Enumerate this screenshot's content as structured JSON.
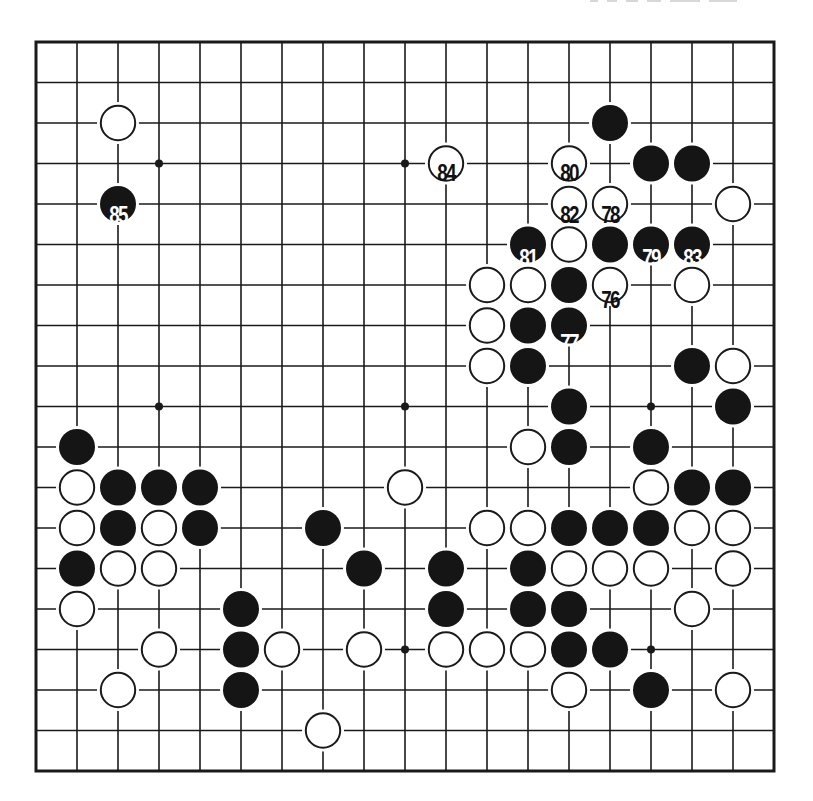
{
  "diagram": {
    "type": "go-board",
    "size": 19,
    "colors": {
      "line": "#1a1a1a",
      "black_stone": "#151515",
      "white_stone": "#ffffff",
      "paper": "#ffffff"
    },
    "geometry": {
      "origin_x": 36,
      "origin_y": 42,
      "step_x": 41,
      "step_y": 40.5,
      "stone_radius": 18
    },
    "star_points": [
      [
        3,
        3
      ],
      [
        9,
        3
      ],
      [
        15,
        3
      ],
      [
        3,
        9
      ],
      [
        9,
        9
      ],
      [
        15,
        9
      ],
      [
        3,
        15
      ],
      [
        9,
        15
      ],
      [
        15,
        15
      ]
    ],
    "move_range": "76-85",
    "stones": [
      {
        "c": 14,
        "r": 2,
        "color": "black",
        "label": ""
      },
      {
        "c": 15,
        "r": 3,
        "color": "black",
        "label": ""
      },
      {
        "c": 16,
        "r": 3,
        "color": "black",
        "label": ""
      },
      {
        "c": 2,
        "r": 4,
        "color": "black",
        "label": "85"
      },
      {
        "c": 12,
        "r": 5,
        "color": "black",
        "label": "81"
      },
      {
        "c": 14,
        "r": 5,
        "color": "black",
        "label": ""
      },
      {
        "c": 15,
        "r": 5,
        "color": "black",
        "label": "79"
      },
      {
        "c": 16,
        "r": 5,
        "color": "black",
        "label": "83"
      },
      {
        "c": 13,
        "r": 6,
        "color": "black",
        "label": ""
      },
      {
        "c": 12,
        "r": 7,
        "color": "black",
        "label": ""
      },
      {
        "c": 13,
        "r": 7,
        "color": "black",
        "label": "77"
      },
      {
        "c": 12,
        "r": 8,
        "color": "black",
        "label": ""
      },
      {
        "c": 16,
        "r": 8,
        "color": "black",
        "label": ""
      },
      {
        "c": 13,
        "r": 9,
        "color": "black",
        "label": ""
      },
      {
        "c": 17,
        "r": 9,
        "color": "black",
        "label": ""
      },
      {
        "c": 1,
        "r": 10,
        "color": "black",
        "label": ""
      },
      {
        "c": 13,
        "r": 10,
        "color": "black",
        "label": ""
      },
      {
        "c": 15,
        "r": 10,
        "color": "black",
        "label": ""
      },
      {
        "c": 2,
        "r": 11,
        "color": "black",
        "label": ""
      },
      {
        "c": 3,
        "r": 11,
        "color": "black",
        "label": ""
      },
      {
        "c": 4,
        "r": 11,
        "color": "black",
        "label": ""
      },
      {
        "c": 16,
        "r": 11,
        "color": "black",
        "label": ""
      },
      {
        "c": 17,
        "r": 11,
        "color": "black",
        "label": ""
      },
      {
        "c": 2,
        "r": 12,
        "color": "black",
        "label": ""
      },
      {
        "c": 4,
        "r": 12,
        "color": "black",
        "label": ""
      },
      {
        "c": 7,
        "r": 12,
        "color": "black",
        "label": ""
      },
      {
        "c": 13,
        "r": 12,
        "color": "black",
        "label": ""
      },
      {
        "c": 14,
        "r": 12,
        "color": "black",
        "label": ""
      },
      {
        "c": 15,
        "r": 12,
        "color": "black",
        "label": ""
      },
      {
        "c": 1,
        "r": 13,
        "color": "black",
        "label": ""
      },
      {
        "c": 8,
        "r": 13,
        "color": "black",
        "label": ""
      },
      {
        "c": 10,
        "r": 13,
        "color": "black",
        "label": ""
      },
      {
        "c": 12,
        "r": 13,
        "color": "black",
        "label": ""
      },
      {
        "c": 5,
        "r": 14,
        "color": "black",
        "label": ""
      },
      {
        "c": 10,
        "r": 14,
        "color": "black",
        "label": ""
      },
      {
        "c": 12,
        "r": 14,
        "color": "black",
        "label": ""
      },
      {
        "c": 13,
        "r": 14,
        "color": "black",
        "label": ""
      },
      {
        "c": 5,
        "r": 15,
        "color": "black",
        "label": ""
      },
      {
        "c": 13,
        "r": 15,
        "color": "black",
        "label": ""
      },
      {
        "c": 14,
        "r": 15,
        "color": "black",
        "label": ""
      },
      {
        "c": 5,
        "r": 16,
        "color": "black",
        "label": ""
      },
      {
        "c": 15,
        "r": 16,
        "color": "black",
        "label": ""
      },
      {
        "c": 2,
        "r": 2,
        "color": "white",
        "label": ""
      },
      {
        "c": 10,
        "r": 3,
        "color": "white",
        "label": "84"
      },
      {
        "c": 13,
        "r": 3,
        "color": "white",
        "label": "80"
      },
      {
        "c": 13,
        "r": 4,
        "color": "white",
        "label": "82"
      },
      {
        "c": 14,
        "r": 4,
        "color": "white",
        "label": "78"
      },
      {
        "c": 17,
        "r": 4,
        "color": "white",
        "label": ""
      },
      {
        "c": 13,
        "r": 5,
        "color": "white",
        "label": ""
      },
      {
        "c": 11,
        "r": 6,
        "color": "white",
        "label": ""
      },
      {
        "c": 12,
        "r": 6,
        "color": "white",
        "label": ""
      },
      {
        "c": 14,
        "r": 6,
        "color": "white",
        "label": "76"
      },
      {
        "c": 16,
        "r": 6,
        "color": "white",
        "label": ""
      },
      {
        "c": 11,
        "r": 7,
        "color": "white",
        "label": ""
      },
      {
        "c": 11,
        "r": 8,
        "color": "white",
        "label": ""
      },
      {
        "c": 17,
        "r": 8,
        "color": "white",
        "label": ""
      },
      {
        "c": 12,
        "r": 10,
        "color": "white",
        "label": ""
      },
      {
        "c": 1,
        "r": 11,
        "color": "white",
        "label": ""
      },
      {
        "c": 9,
        "r": 11,
        "color": "white",
        "label": ""
      },
      {
        "c": 15,
        "r": 11,
        "color": "white",
        "label": ""
      },
      {
        "c": 1,
        "r": 12,
        "color": "white",
        "label": ""
      },
      {
        "c": 3,
        "r": 12,
        "color": "white",
        "label": ""
      },
      {
        "c": 11,
        "r": 12,
        "color": "white",
        "label": ""
      },
      {
        "c": 12,
        "r": 12,
        "color": "white",
        "label": ""
      },
      {
        "c": 16,
        "r": 12,
        "color": "white",
        "label": ""
      },
      {
        "c": 17,
        "r": 12,
        "color": "white",
        "label": ""
      },
      {
        "c": 2,
        "r": 13,
        "color": "white",
        "label": ""
      },
      {
        "c": 3,
        "r": 13,
        "color": "white",
        "label": ""
      },
      {
        "c": 13,
        "r": 13,
        "color": "white",
        "label": ""
      },
      {
        "c": 14,
        "r": 13,
        "color": "white",
        "label": ""
      },
      {
        "c": 15,
        "r": 13,
        "color": "white",
        "label": ""
      },
      {
        "c": 17,
        "r": 13,
        "color": "white",
        "label": ""
      },
      {
        "c": 1,
        "r": 14,
        "color": "white",
        "label": ""
      },
      {
        "c": 16,
        "r": 14,
        "color": "white",
        "label": ""
      },
      {
        "c": 3,
        "r": 15,
        "color": "white",
        "label": ""
      },
      {
        "c": 6,
        "r": 15,
        "color": "white",
        "label": ""
      },
      {
        "c": 8,
        "r": 15,
        "color": "white",
        "label": ""
      },
      {
        "c": 10,
        "r": 15,
        "color": "white",
        "label": ""
      },
      {
        "c": 11,
        "r": 15,
        "color": "white",
        "label": ""
      },
      {
        "c": 12,
        "r": 15,
        "color": "white",
        "label": ""
      },
      {
        "c": 2,
        "r": 16,
        "color": "white",
        "label": ""
      },
      {
        "c": 13,
        "r": 16,
        "color": "white",
        "label": ""
      },
      {
        "c": 17,
        "r": 16,
        "color": "white",
        "label": ""
      },
      {
        "c": 7,
        "r": 17,
        "color": "white",
        "label": ""
      }
    ]
  }
}
